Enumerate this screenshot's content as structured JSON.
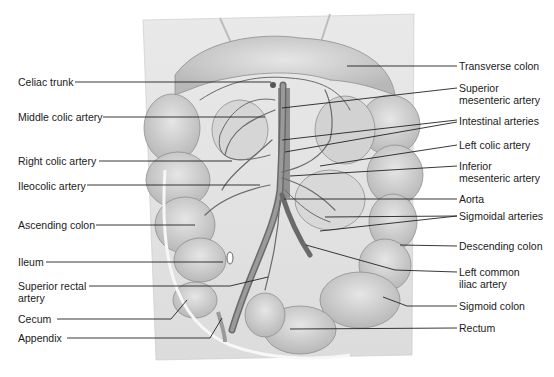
{
  "figure": {
    "left_labels": [
      {
        "id": "celiac-trunk",
        "text": "Celiac trunk",
        "x": 18,
        "y": 76
      },
      {
        "id": "middle-colic-artery",
        "text": "Middle colic artery",
        "x": 18,
        "y": 111
      },
      {
        "id": "right-colic-artery",
        "text": "Right colic artery",
        "x": 18,
        "y": 155
      },
      {
        "id": "ileocolic-artery",
        "text": "Ileocolic artery",
        "x": 18,
        "y": 180
      },
      {
        "id": "ascending-colon",
        "text": "Ascending colon",
        "x": 18,
        "y": 220
      },
      {
        "id": "ileum",
        "text": "Ileum",
        "x": 18,
        "y": 257
      },
      {
        "id": "superior-rectal-artery",
        "line1": "Superior rectal",
        "line2": "artery",
        "x": 18,
        "y": 281
      },
      {
        "id": "cecum",
        "text": "Cecum",
        "x": 18,
        "y": 314
      },
      {
        "id": "appendix",
        "text": "Appendix",
        "x": 18,
        "y": 333
      }
    ],
    "right_labels": [
      {
        "id": "transverse-colon",
        "text": "Transverse colon",
        "x": 459,
        "y": 58
      },
      {
        "id": "superior-mesenteric-artery",
        "line1": "Superior",
        "line2": "mesenteric artery",
        "x": 459,
        "y": 82
      },
      {
        "id": "intestinal-arteries",
        "text": "Intestinal arteries",
        "x": 459,
        "y": 115
      },
      {
        "id": "left-colic-artery",
        "text": "Left colic artery",
        "x": 459,
        "y": 139
      },
      {
        "id": "inferior-mesenteric-artery",
        "line1": "Inferior",
        "line2": "mesenteric artery",
        "x": 459,
        "y": 160
      },
      {
        "id": "aorta",
        "text": "Aorta",
        "x": 459,
        "y": 192
      },
      {
        "id": "sigmoidal-arteries",
        "text": "Sigmoidal arteries",
        "x": 459,
        "y": 209
      },
      {
        "id": "descending-colon",
        "text": "Descending colon",
        "x": 459,
        "y": 239
      },
      {
        "id": "left-common-iliac-artery",
        "line1": "Left common",
        "line2": "iliac artery",
        "x": 459,
        "y": 264
      },
      {
        "id": "sigmoid-colon",
        "text": "Sigmoid colon",
        "x": 459,
        "y": 300
      },
      {
        "id": "rectum",
        "text": "Rectum",
        "x": 459,
        "y": 321
      }
    ]
  }
}
